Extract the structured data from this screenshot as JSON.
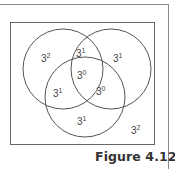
{
  "figure": {
    "caption": "Figure 4.12",
    "colors": {
      "stroke": "#555555",
      "text": "#444444",
      "caption": "#333333",
      "frame": "#8a8a8a"
    }
  },
  "venn": {
    "circles": [
      {
        "id": "top-left",
        "cx": 63,
        "cy": 69,
        "r": 40
      },
      {
        "id": "top-right",
        "cx": 111,
        "cy": 69,
        "r": 40
      },
      {
        "id": "bottom",
        "cx": 85,
        "cy": 97,
        "r": 40
      }
    ],
    "regions": [
      {
        "region": "top-left only",
        "base": "3",
        "exp": "2",
        "x": 41,
        "y": 62
      },
      {
        "region": "top-left and top-right",
        "base": "3",
        "exp": "1",
        "x": 76,
        "y": 57
      },
      {
        "region": "top-right only",
        "base": "3",
        "exp": "1",
        "x": 113,
        "y": 62
      },
      {
        "region": "all three",
        "base": "3",
        "exp": "0",
        "x": 77,
        "y": 79
      },
      {
        "region": "top-left and bottom",
        "base": "3",
        "exp": "1",
        "x": 53,
        "y": 97
      },
      {
        "region": "top-right and bottom",
        "base": "3",
        "exp": "0",
        "x": 96,
        "y": 95
      },
      {
        "region": "bottom only",
        "base": "3",
        "exp": "1",
        "x": 77,
        "y": 125
      },
      {
        "region": "outside",
        "base": "3",
        "exp": "2",
        "x": 131,
        "y": 134
      }
    ]
  }
}
